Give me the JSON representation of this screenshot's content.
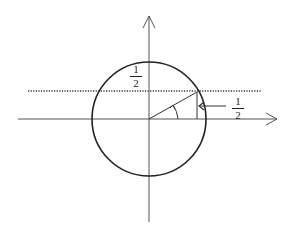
{
  "diagram": {
    "type": "unit-circle",
    "labels": {
      "top_fraction": {
        "numerator": "1",
        "denominator": "2"
      },
      "right_fraction": {
        "numerator": "1",
        "denominator": "2"
      }
    },
    "geometry": {
      "center": [
        149,
        119
      ],
      "radius": 57,
      "dotted_line_y": 91,
      "point_on_circle": [
        197,
        91
      ]
    },
    "colors": {
      "stroke": "#222222",
      "axis": "#555555",
      "background": "#ffffff"
    }
  }
}
